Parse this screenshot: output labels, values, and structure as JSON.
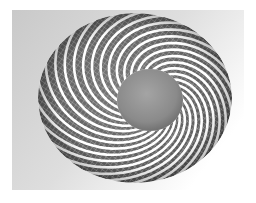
{
  "image": {
    "subject": "wireframe torus with spiral bands",
    "description": "Grayscale 3D render of a torus wrapped with thick white helical bands over a fine white grid on dark gray, with a gray spherical center hole, on a light gray gradient background panel."
  },
  "colors": {
    "page_background": "#ffffff",
    "panel_top_left": "#c8c8c8",
    "panel_bottom_right": "#ffffff",
    "torus_dark": "#6a6a6a",
    "torus_shadow": "#4a4a4a",
    "band_white": "#ffffff",
    "grid_line": "#d8d8d8",
    "hole_center": "#9a9a9a",
    "hole_edge": "#6e6e6e"
  },
  "geometry": {
    "panel": {
      "x": 12,
      "y": 10,
      "w": 232,
      "h": 180
    },
    "torus": {
      "cx": 135,
      "cy": 98,
      "rx": 97,
      "ry": 85
    },
    "hole": {
      "cx": 150,
      "cy": 100,
      "rx": 33,
      "ry": 31
    },
    "band_count": 26
  }
}
